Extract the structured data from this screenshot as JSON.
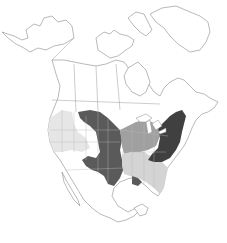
{
  "map": {
    "type": "range-map",
    "region": "North America",
    "legend_shown": false,
    "labels_shown": false,
    "shades": {
      "dark": "#4a4a4a",
      "darker": "#3a3a3a",
      "medium": "#9c9c9c",
      "light": "#d4d4d4",
      "lighter": "#e6e6e6",
      "none": "#ffffff",
      "outline": "#8a8a8a"
    },
    "zones": [
      {
        "id": "northern-plains-central",
        "shade": "dark"
      },
      {
        "id": "northeast-appalachia",
        "shade": "darker"
      },
      {
        "id": "midwest",
        "shade": "medium"
      },
      {
        "id": "southeast",
        "shade": "light"
      },
      {
        "id": "pacific-northwest-intermountain",
        "shade": "lighter"
      }
    ]
  }
}
